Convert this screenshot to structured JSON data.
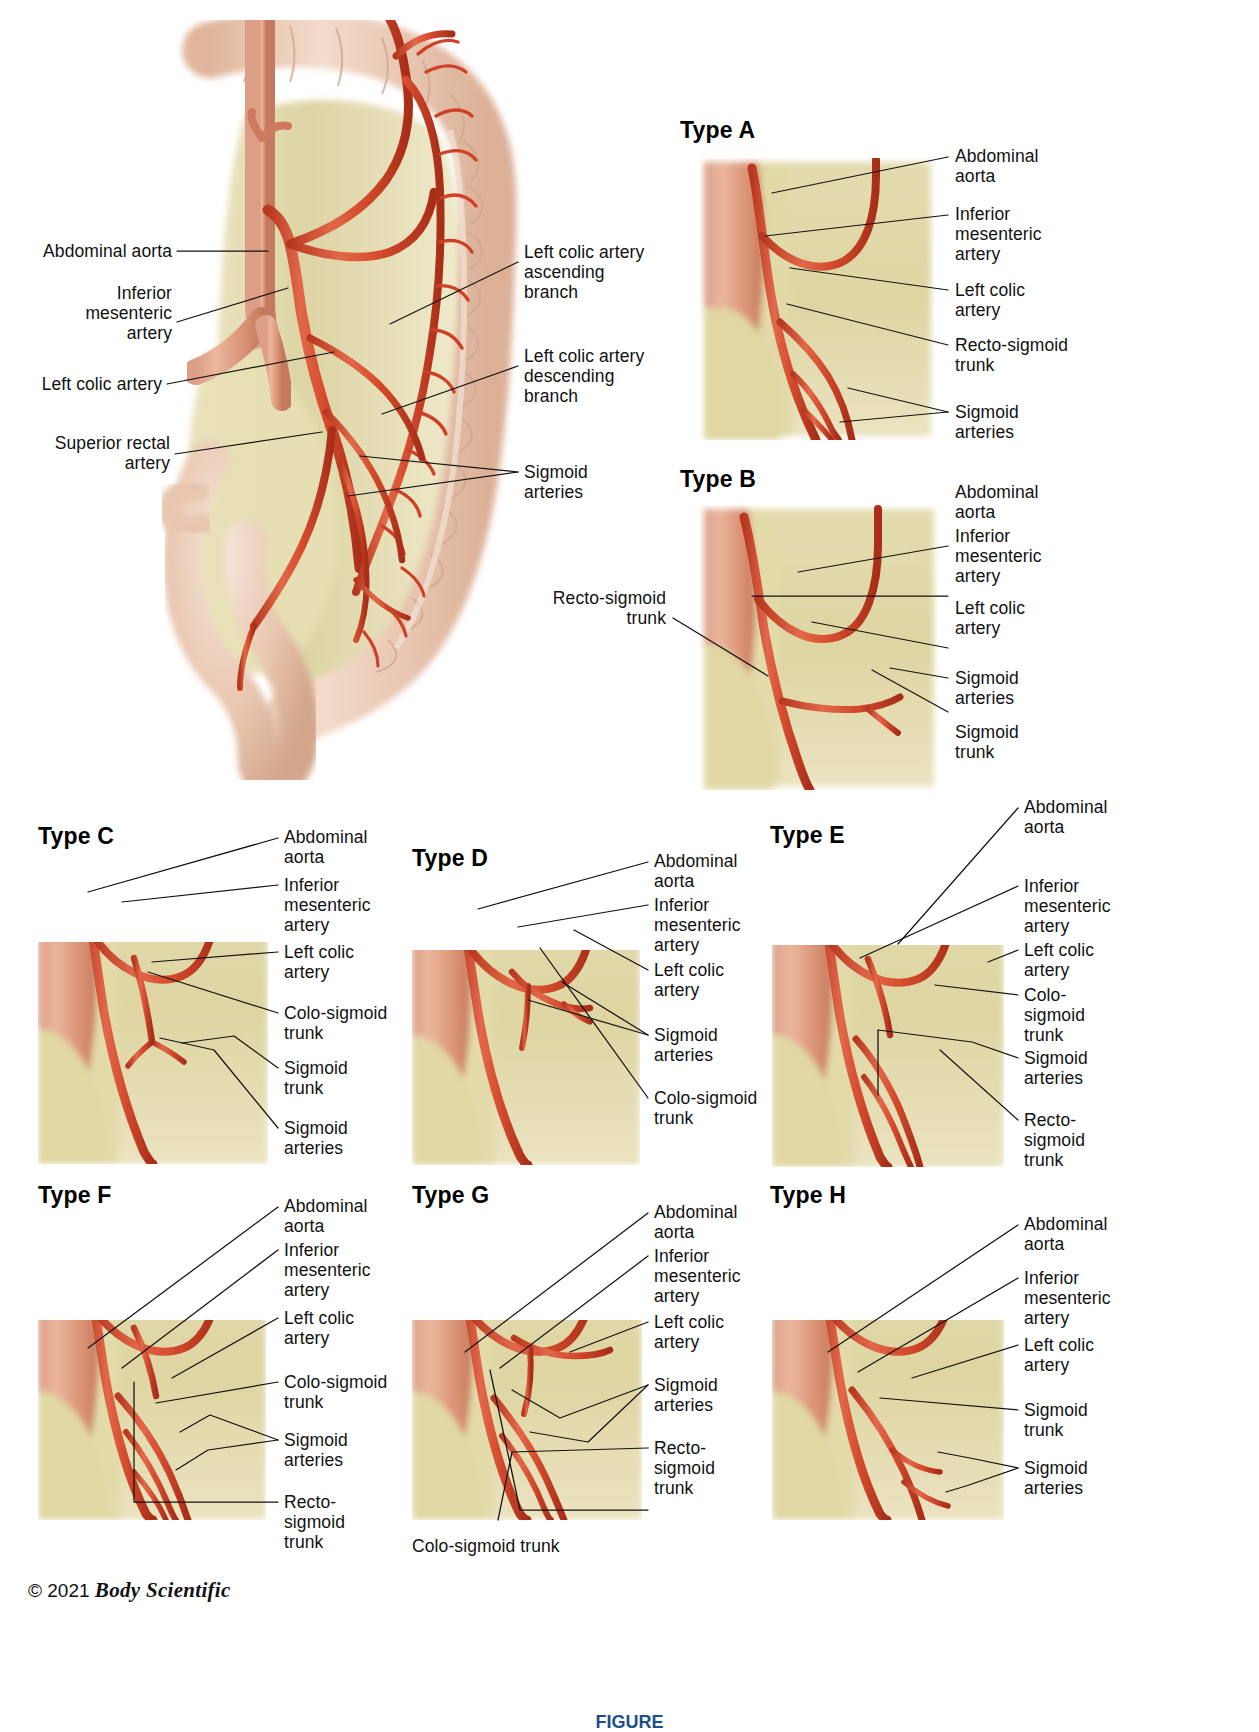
{
  "meta": {
    "copyright_symbol": "©",
    "copyright_year": "2021",
    "copyright_brand": "Body Scientific",
    "figure_caption": "FIGURE"
  },
  "colors": {
    "artery": "#d9472f",
    "artery_light": "#e8704f",
    "artery_dark": "#a93420",
    "mesentery": "#dcd3a3",
    "mesentery_light": "#eae4c2",
    "colon": "#e8c3ad",
    "colon_light": "#f3ded0",
    "leader": "#15120f",
    "caption": "#1b4f8a"
  },
  "overview": {
    "name": "Inferior mesenteric artery overview",
    "labels": [
      {
        "id": "abdominal-aorta",
        "text": "Abdominal aorta",
        "side": "left"
      },
      {
        "id": "inferior-mesenteric-artery",
        "text": "Inferior\nmesenteric\nartery",
        "side": "left"
      },
      {
        "id": "left-colic-artery",
        "text": "Left colic artery",
        "side": "left"
      },
      {
        "id": "superior-rectal-artery",
        "text": "Superior rectal\nartery",
        "side": "left"
      },
      {
        "id": "left-colic-ascending",
        "text": "Left colic artery\nascending\nbranch",
        "side": "right"
      },
      {
        "id": "left-colic-descending",
        "text": "Left colic artery\ndescending\nbranch",
        "side": "right"
      },
      {
        "id": "sigmoid-arteries",
        "text": "Sigmoid\narteries",
        "side": "right"
      }
    ]
  },
  "types": [
    {
      "id": "type-a",
      "title": "Type A",
      "labels": [
        {
          "id": "abdominal-aorta",
          "text": "Abdominal\naorta"
        },
        {
          "id": "inferior-mesenteric-artery",
          "text": "Inferior\nmesenteric\nartery"
        },
        {
          "id": "left-colic-artery",
          "text": "Left colic\nartery"
        },
        {
          "id": "recto-sigmoid-trunk",
          "text": "Recto-sigmoid\ntrunk"
        },
        {
          "id": "sigmoid-arteries",
          "text": "Sigmoid\narteries"
        }
      ]
    },
    {
      "id": "type-b",
      "title": "Type B",
      "labels": [
        {
          "id": "recto-sigmoid-trunk",
          "text": "Recto-sigmoid\ntrunk"
        },
        {
          "id": "abdominal-aorta",
          "text": "Abdominal\naorta"
        },
        {
          "id": "inferior-mesenteric-artery",
          "text": "Inferior\nmesenteric\nartery"
        },
        {
          "id": "left-colic-artery",
          "text": "Left colic\nartery"
        },
        {
          "id": "sigmoid-arteries",
          "text": "Sigmoid\narteries"
        },
        {
          "id": "sigmoid-trunk",
          "text": "Sigmoid\ntrunk"
        }
      ]
    },
    {
      "id": "type-c",
      "title": "Type C",
      "labels": [
        {
          "id": "abdominal-aorta",
          "text": "Abdominal\naorta"
        },
        {
          "id": "inferior-mesenteric-artery",
          "text": "Inferior\nmesenteric\nartery"
        },
        {
          "id": "left-colic-artery",
          "text": "Left colic\nartery"
        },
        {
          "id": "colo-sigmoid-trunk",
          "text": "Colo-sigmoid\ntrunk"
        },
        {
          "id": "sigmoid-trunk",
          "text": "Sigmoid\ntrunk"
        },
        {
          "id": "sigmoid-arteries",
          "text": "Sigmoid\narteries"
        }
      ]
    },
    {
      "id": "type-d",
      "title": "Type D",
      "labels": [
        {
          "id": "abdominal-aorta",
          "text": "Abdominal\naorta"
        },
        {
          "id": "inferior-mesenteric-artery",
          "text": "Inferior\nmesenteric\nartery"
        },
        {
          "id": "left-colic-artery",
          "text": "Left colic\nartery"
        },
        {
          "id": "sigmoid-arteries",
          "text": "Sigmoid\narteries"
        },
        {
          "id": "colo-sigmoid-trunk",
          "text": "Colo-sigmoid\ntrunk"
        }
      ]
    },
    {
      "id": "type-e",
      "title": "Type E",
      "labels": [
        {
          "id": "abdominal-aorta",
          "text": "Abdominal\naorta"
        },
        {
          "id": "inferior-mesenteric-artery",
          "text": "Inferior\nmesenteric\nartery"
        },
        {
          "id": "left-colic-artery",
          "text": "Left colic\nartery"
        },
        {
          "id": "colo-sigmoid-trunk",
          "text": "Colo-\nsigmoid\ntrunk"
        },
        {
          "id": "sigmoid-arteries",
          "text": "Sigmoid\narteries"
        },
        {
          "id": "recto-sigmoid-trunk",
          "text": "Recto-\nsigmoid\ntrunk"
        }
      ]
    },
    {
      "id": "type-f",
      "title": "Type F",
      "labels": [
        {
          "id": "abdominal-aorta",
          "text": "Abdominal\naorta"
        },
        {
          "id": "inferior-mesenteric-artery",
          "text": "Inferior\nmesenteric\nartery"
        },
        {
          "id": "left-colic-artery",
          "text": "Left colic\nartery"
        },
        {
          "id": "colo-sigmoid-trunk",
          "text": "Colo-sigmoid\ntrunk"
        },
        {
          "id": "sigmoid-arteries",
          "text": "Sigmoid\narteries"
        },
        {
          "id": "recto-sigmoid-trunk",
          "text": "Recto-\nsigmoid\ntrunk"
        }
      ]
    },
    {
      "id": "type-g",
      "title": "Type G",
      "labels": [
        {
          "id": "abdominal-aorta",
          "text": "Abdominal\naorta"
        },
        {
          "id": "inferior-mesenteric-artery",
          "text": "Inferior\nmesenteric\nartery"
        },
        {
          "id": "left-colic-artery",
          "text": "Left colic\nartery"
        },
        {
          "id": "sigmoid-arteries",
          "text": "Sigmoid\narteries"
        },
        {
          "id": "recto-sigmoid-trunk",
          "text": "Recto-\nsigmoid\ntrunk"
        },
        {
          "id": "colo-sigmoid-trunk",
          "text": "Colo-sigmoid trunk"
        }
      ]
    },
    {
      "id": "type-h",
      "title": "Type H",
      "labels": [
        {
          "id": "abdominal-aorta",
          "text": "Abdominal\naorta"
        },
        {
          "id": "inferior-mesenteric-artery",
          "text": "Inferior\nmesenteric\nartery"
        },
        {
          "id": "left-colic-artery",
          "text": "Left colic\nartery"
        },
        {
          "id": "sigmoid-trunk",
          "text": "Sigmoid\ntrunk"
        },
        {
          "id": "sigmoid-arteries",
          "text": "Sigmoid\narteries"
        }
      ]
    }
  ]
}
